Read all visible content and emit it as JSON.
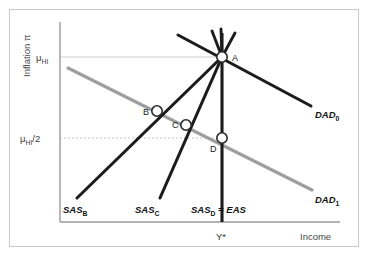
{
  "figure": {
    "background_color": "#ffffff",
    "border_color": "#c9c9c9"
  },
  "axes": {
    "y_axis_title": "Inflation π",
    "x_axis_title": "Income",
    "axis_color": "#9a9a9a",
    "y_ticks": [
      {
        "id": "mu-hi",
        "base": "μ",
        "sub": "HI",
        "suffix": "",
        "value_label": "μ_HI",
        "y": 57
      },
      {
        "id": "mu-hi-half",
        "base": "μ",
        "sub": "HI",
        "suffix": "/2",
        "value_label": "μ_HI/2",
        "y": 138
      }
    ],
    "x_ticks": [
      {
        "id": "y-star",
        "label": "Y*",
        "x": 222
      }
    ],
    "gridlines": {
      "mu_hi_color": "#cfcfcf",
      "mu_hi_half_color": "#b9b9b9",
      "mu_hi_half_style": "dotted"
    }
  },
  "curves": {
    "dad0": {
      "label_base": "DAD",
      "label_sub": "0",
      "label_full": "DAD0",
      "color": "#1c1c1c",
      "width": 3.1,
      "x1": 178,
      "y1": 35,
      "x2": 311,
      "y2": 106
    },
    "dad1": {
      "label_base": "DAD",
      "label_sub": "1",
      "label_full": "DAD1",
      "color": "#9e9e9e",
      "width": 3.1,
      "x1": 68,
      "y1": 68,
      "x2": 312,
      "y2": 190
    },
    "sas_b": {
      "label_base": "SAS",
      "label_sub": "B",
      "label_full": "SASB",
      "color": "#1c1c1c",
      "width": 3.1,
      "x1": 77,
      "y1": 198,
      "x2": 222,
      "y2": 57
    },
    "sas_c": {
      "label_base": "SAS",
      "label_sub": "C",
      "label_full": "SASC",
      "color": "#1c1c1c",
      "width": 3.1,
      "x1": 160,
      "y1": 198,
      "x2": 222,
      "y2": 57
    },
    "sas_d": {
      "label_base": "SAS",
      "label_sub": "D",
      "label_suffix": " = EAS",
      "label_full": "SASD = EAS",
      "color": "#1c1c1c",
      "width": 3.1,
      "x1": 222,
      "y1": 222,
      "x2": 222,
      "y2": 33
    }
  },
  "arrows": [
    {
      "id": "arrow-1",
      "x1": 222,
      "y1": 57,
      "x2": 212,
      "y2": 31
    },
    {
      "id": "arrow-2",
      "x1": 222,
      "y1": 57,
      "x2": 220,
      "y2": 29
    },
    {
      "id": "arrow-3",
      "x1": 222,
      "y1": 57,
      "x2": 234,
      "y2": 33
    }
  ],
  "points": [
    {
      "id": "point-a",
      "label": "A",
      "x": 222,
      "y": 57,
      "label_dx": 10,
      "label_dy": 4,
      "filled": true
    },
    {
      "id": "point-b",
      "label": "B",
      "x": 157,
      "y": 111,
      "label_dx": -14,
      "label_dy": 4,
      "filled": false
    },
    {
      "id": "point-c",
      "label": "C",
      "x": 186,
      "y": 125,
      "label_dx": -14,
      "label_dy": 3,
      "filled": false
    },
    {
      "id": "point-d",
      "label": "D",
      "x": 222,
      "y": 138,
      "label_dx": -12,
      "label_dy": 14,
      "filled": false
    }
  ],
  "point_style": {
    "radius": 5.2,
    "fill": "#ffffff",
    "stroke": "#2a2a2a",
    "stroke_width": 1.6
  }
}
